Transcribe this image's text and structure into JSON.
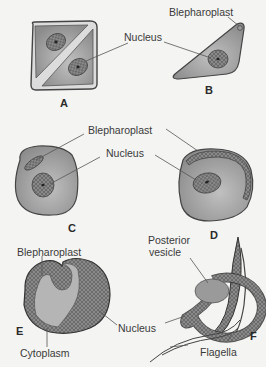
{
  "figure": {
    "panels": [
      {
        "id": "A",
        "label": "A",
        "labels": [
          "Nucleus"
        ]
      },
      {
        "id": "B",
        "label": "B",
        "labels": [
          "Blepharoplast",
          "Nucleus"
        ]
      },
      {
        "id": "C",
        "label": "C",
        "labels": [
          "Blepharoplast",
          "Nucleus"
        ]
      },
      {
        "id": "D",
        "label": "D",
        "labels": [
          "Blepharoplast",
          "Nucleus"
        ]
      },
      {
        "id": "E",
        "label": "E",
        "labels": [
          "Blepharoplast",
          "Nucleus",
          "Cytoplasm"
        ]
      },
      {
        "id": "F",
        "label": "F",
        "labels": [
          "Posterior vesicle",
          "Flagella"
        ]
      }
    ],
    "text": {
      "nucleus_ab": "Nucleus",
      "blepharoplast_b": "Blepharoplast",
      "blepharoplast_cd": "Blepharoplast",
      "nucleus_cd": "Nucleus",
      "blepharoplast_e": "Blepharoplast",
      "nucleus_ef": "Nucleus",
      "cytoplasm_e": "Cytoplasm",
      "posterior_line1": "Posterior",
      "posterior_line2": "vesicle",
      "flagella_f": "Flagella",
      "panel_a": "A",
      "panel_b": "B",
      "panel_c": "C",
      "panel_d": "D",
      "panel_e": "E",
      "panel_f": "F"
    },
    "colors": {
      "background": "#f4f4f2",
      "cell_fill": "#9a9a9a",
      "cell_outline": "#4a4a4a",
      "nucleus_fill": "#7d7d7d",
      "light_fill": "#c8c8c8",
      "text": "#3a3a3a"
    }
  }
}
